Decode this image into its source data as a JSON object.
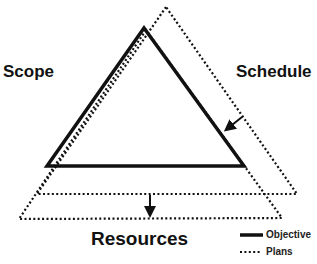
{
  "diagram": {
    "labels": {
      "scope": "Scope",
      "schedule": "Schedule",
      "resources": "Resources"
    },
    "legend": [
      {
        "style": "solid",
        "label": "Objective"
      },
      {
        "style": "dotted",
        "label": "Plans"
      }
    ],
    "shapes": {
      "objective_triangle": {
        "style": "solid",
        "points": [
          [
            144,
            28
          ],
          [
            47,
            166
          ],
          [
            244,
            166
          ]
        ]
      },
      "plans_triangle_schedule_shift": {
        "style": "dotted",
        "points": [
          [
            166,
            7
          ],
          [
            37,
            194
          ],
          [
            297,
            194
          ]
        ]
      },
      "plans_triangle_resources_shift": {
        "style": "dotted",
        "points": [
          [
            146,
            30
          ],
          [
            19,
            219
          ],
          [
            282,
            218
          ]
        ]
      }
    },
    "arrows": [
      {
        "name": "schedule-arrow",
        "from": [
          242,
          117
        ],
        "to": [
          225,
          131
        ]
      },
      {
        "name": "resources-arrow",
        "from": [
          150,
          195
        ],
        "to": [
          150,
          217
        ]
      }
    ],
    "colors": {
      "line": "#111111",
      "background": "#ffffff"
    }
  }
}
